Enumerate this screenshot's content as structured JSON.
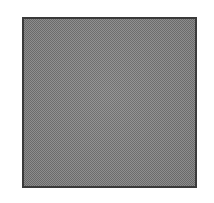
{
  "swatch": {
    "label": "Gray dithered square",
    "fill_color": "#8a8a8a",
    "dither_color": "#6e6e6e",
    "border_color": "#3a3a3a",
    "background_color": "#ffffff"
  }
}
